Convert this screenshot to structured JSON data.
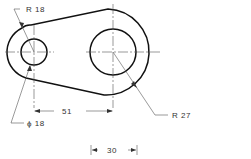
{
  "drawing": {
    "type": "mechanical-link-part",
    "labels": {
      "small_outer_radius": "R 18",
      "small_hole_diameter": "ϕ 18",
      "center_distance": "51",
      "large_outer_radius": "R 27",
      "bottom_dimension": "30"
    },
    "colors": {
      "outline": "#111111",
      "centerline": "#555555",
      "text": "#333333"
    }
  }
}
